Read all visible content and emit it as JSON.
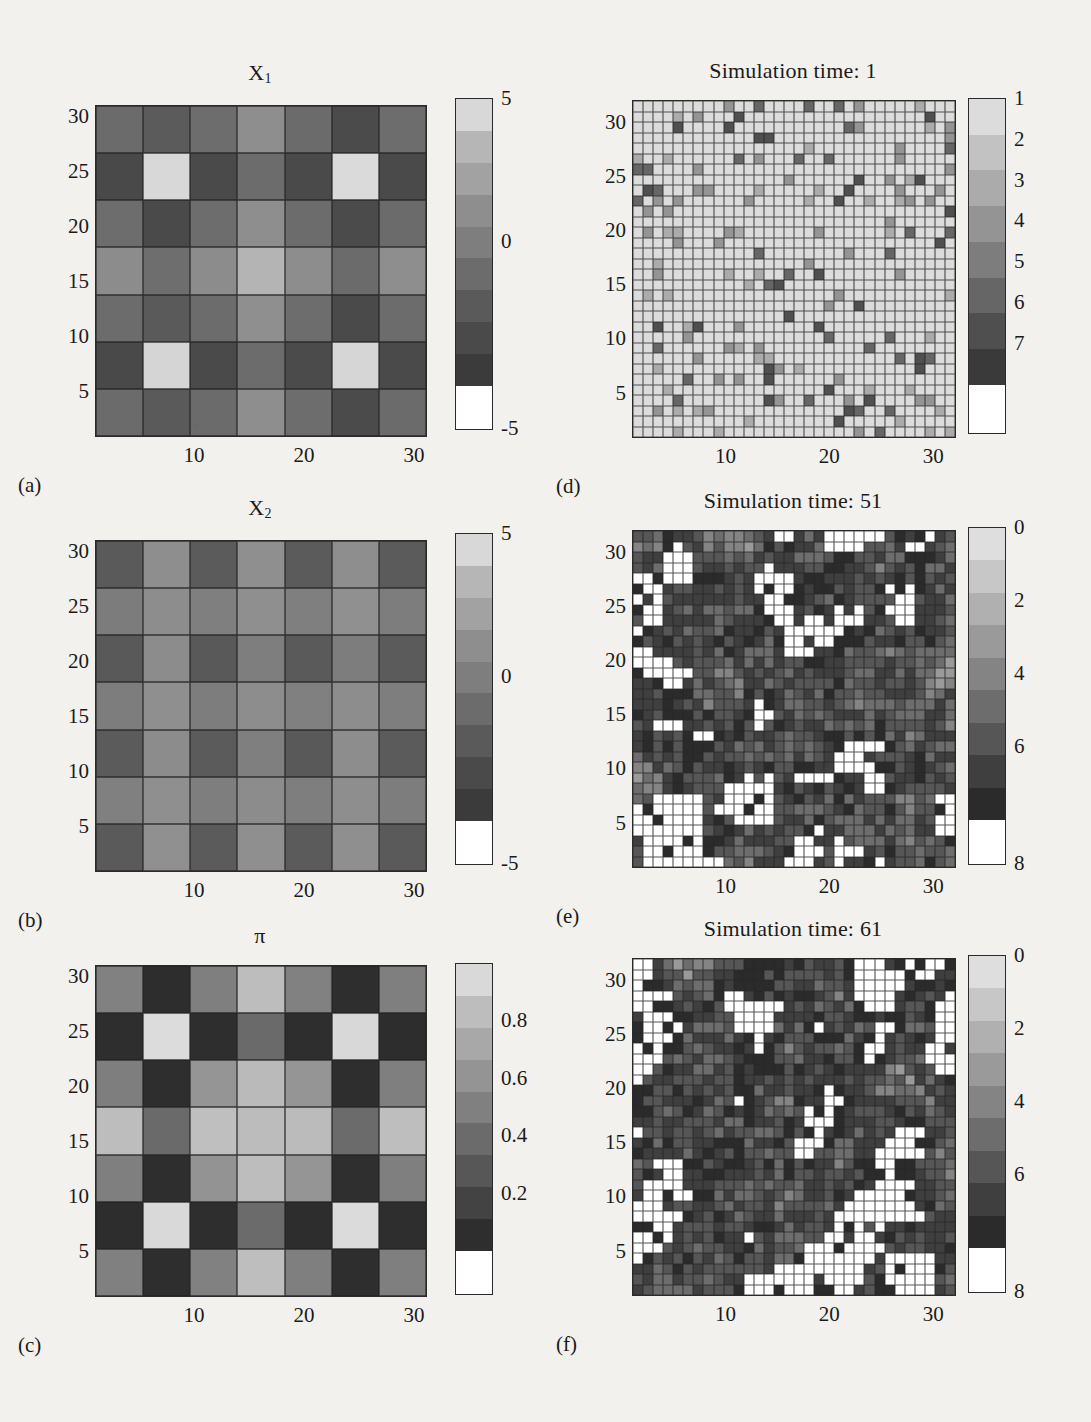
{
  "figure": {
    "background": "#f2f1ed",
    "ink": "#1b1b1b"
  },
  "axes": {
    "y_ticks": [
      "30",
      "25",
      "20",
      "15",
      "10",
      "5"
    ],
    "x_ticks": [
      "10",
      "20",
      "30"
    ]
  },
  "panels": [
    {
      "key": "a",
      "label": "(a)",
      "title": "X",
      "title_sub": "1",
      "grid_n": 7,
      "colorbar": {
        "ticks": [
          "5",
          "0",
          "-5"
        ],
        "top_value": 5,
        "bottom_value": -5,
        "bands": [
          "#d8d8d8",
          "#b6b6b6",
          "#a2a2a2",
          "#8e8e8e",
          "#7e7e7e",
          "#6c6c6c",
          "#5a5a5a",
          "#4a4a4a",
          "#3b3b3b",
          "#ffffff"
        ]
      }
    },
    {
      "key": "b",
      "label": "(b)",
      "title": "X",
      "title_sub": "2",
      "grid_n": 7,
      "colorbar": {
        "ticks": [
          "5",
          "0",
          "-5"
        ],
        "top_value": 5,
        "bottom_value": -5,
        "bands": [
          "#d8d8d8",
          "#b6b6b6",
          "#a2a2a2",
          "#8e8e8e",
          "#7e7e7e",
          "#6c6c6c",
          "#5a5a5a",
          "#4a4a4a",
          "#3b3b3b",
          "#ffffff"
        ]
      }
    },
    {
      "key": "c",
      "label": "(c)",
      "title": "π",
      "title_sub": "",
      "grid_n": 7,
      "colorbar": {
        "ticks": [
          "0.8",
          "0.6",
          "0.4",
          "0.2"
        ],
        "top_value": 1.0,
        "bottom_value": 0.0,
        "bands": [
          "#d9d9d9",
          "#bdbdbd",
          "#a8a8a8",
          "#949494",
          "#808080",
          "#6b6b6b",
          "#575757",
          "#434343",
          "#2e2e2e",
          "#ffffff"
        ]
      }
    },
    {
      "key": "d",
      "label": "(d)",
      "title": "Simulation time: 1",
      "title_sub": "",
      "grid_n": 32,
      "colorbar": {
        "ticks": [
          "7",
          "6",
          "5",
          "4",
          "3",
          "2",
          "1"
        ],
        "top_value": 7,
        "bottom_value": 0,
        "bands": [
          "#dcdcdc",
          "#c2c2c2",
          "#ababab",
          "#949494",
          "#7d7d7d",
          "#666666",
          "#4f4f4f",
          "#3a3a3a",
          "#ffffff"
        ]
      }
    },
    {
      "key": "e",
      "label": "(e)",
      "title": "Simulation time: 51",
      "title_sub": "",
      "grid_n": 32,
      "colorbar": {
        "ticks": [
          "8",
          "6",
          "4",
          "2",
          "0"
        ],
        "top_value": 8,
        "bottom_value": 0,
        "bands": [
          "#dedede",
          "#c7c7c7",
          "#b0b0b0",
          "#9a9a9a",
          "#848484",
          "#6d6d6d",
          "#565656",
          "#3f3f3f",
          "#2b2b2b",
          "#ffffff"
        ]
      }
    },
    {
      "key": "f",
      "label": "(f)",
      "title": "Simulation time: 61",
      "title_sub": "",
      "grid_n": 32,
      "colorbar": {
        "ticks": [
          "8",
          "6",
          "4",
          "2",
          "0"
        ],
        "top_value": 8,
        "bottom_value": 0,
        "bands": [
          "#dedede",
          "#c7c7c7",
          "#b0b0b0",
          "#9a9a9a",
          "#848484",
          "#6d6d6d",
          "#565656",
          "#3f3f3f",
          "#2b2b2b",
          "#ffffff"
        ]
      }
    }
  ],
  "chart_data": [
    {
      "panel": "a",
      "type": "heatmap",
      "title": "X_1",
      "xlabel": "",
      "ylabel": "",
      "grid": "7x7",
      "xlim": [
        1,
        31
      ],
      "ylim": [
        1,
        31
      ],
      "xticks": [
        10,
        20,
        30
      ],
      "yticks": [
        30,
        25,
        20,
        15,
        10,
        5
      ],
      "colorbar_range": [
        -5,
        5
      ],
      "colorbar_ticks": [
        5,
        0,
        -5
      ],
      "values": [
        [
          -0.6,
          -2.6,
          -1.0,
          1.6,
          -0.8,
          -2.8,
          -0.6
        ],
        [
          -2.8,
          5.0,
          -2.9,
          -1.5,
          -2.9,
          5.0,
          -2.8
        ],
        [
          -0.7,
          -2.8,
          -0.7,
          1.2,
          -1.0,
          -2.9,
          -0.7
        ],
        [
          1.6,
          -0.7,
          1.1,
          3.2,
          1.2,
          -0.8,
          1.5
        ],
        [
          -0.7,
          -2.7,
          -0.6,
          1.4,
          -0.8,
          -2.8,
          -0.6
        ],
        [
          -2.8,
          5.0,
          -2.8,
          -1.3,
          -2.8,
          5.0,
          -2.8
        ],
        [
          -0.6,
          -2.6,
          -0.9,
          1.5,
          -0.7,
          -2.8,
          -0.7
        ]
      ]
    },
    {
      "panel": "b",
      "type": "heatmap",
      "title": "X_2",
      "xlabel": "",
      "ylabel": "",
      "grid": "7x7",
      "xlim": [
        1,
        31
      ],
      "ylim": [
        1,
        31
      ],
      "xticks": [
        10,
        20,
        30
      ],
      "yticks": [
        30,
        25,
        20,
        15,
        10,
        5
      ],
      "colorbar_range": [
        -5,
        5
      ],
      "colorbar_ticks": [
        5,
        0,
        -5
      ],
      "values": [
        [
          -2.6,
          0.6,
          -2.6,
          0.6,
          -2.6,
          0.6,
          -2.6
        ],
        [
          0.4,
          1.6,
          0.3,
          1.6,
          0.3,
          1.6,
          0.4
        ],
        [
          -2.7,
          0.6,
          -2.6,
          0.4,
          -2.7,
          0.5,
          -2.7
        ],
        [
          0.4,
          1.6,
          0.3,
          1.2,
          0.3,
          1.6,
          0.4
        ],
        [
          -2.7,
          0.6,
          -2.6,
          0.4,
          -2.7,
          0.6,
          -2.7
        ],
        [
          0.4,
          1.6,
          0.4,
          1.6,
          0.3,
          1.6,
          0.4
        ],
        [
          -2.6,
          0.6,
          -2.6,
          0.6,
          -2.6,
          0.6,
          -2.6
        ]
      ]
    },
    {
      "panel": "c",
      "type": "heatmap",
      "title": "pi",
      "xlabel": "",
      "ylabel": "",
      "grid": "7x7",
      "xlim": [
        1,
        31
      ],
      "ylim": [
        1,
        31
      ],
      "xticks": [
        10,
        20,
        30
      ],
      "yticks": [
        30,
        25,
        20,
        15,
        10,
        5
      ],
      "colorbar_range": [
        0.0,
        1.0
      ],
      "colorbar_ticks": [
        0.8,
        0.6,
        0.4,
        0.2
      ],
      "values": [
        [
          0.55,
          0.1,
          0.55,
          0.8,
          0.55,
          0.1,
          0.55
        ],
        [
          0.1,
          1.0,
          0.1,
          0.42,
          0.1,
          1.0,
          0.1
        ],
        [
          0.55,
          0.1,
          0.58,
          0.78,
          0.58,
          0.1,
          0.55
        ],
        [
          0.82,
          0.4,
          0.8,
          0.88,
          0.8,
          0.42,
          0.82
        ],
        [
          0.55,
          0.1,
          0.58,
          0.78,
          0.58,
          0.1,
          0.55
        ],
        [
          0.1,
          1.0,
          0.1,
          0.42,
          0.1,
          1.0,
          0.1
        ],
        [
          0.55,
          0.1,
          0.55,
          0.8,
          0.55,
          0.1,
          0.55
        ]
      ]
    },
    {
      "panel": "d",
      "type": "heatmap",
      "title": "Simulation time: 1",
      "xlabel": "",
      "ylabel": "",
      "grid": "32x32",
      "xlim": [
        1,
        32
      ],
      "ylim": [
        1,
        32
      ],
      "xticks": [
        10,
        20,
        30
      ],
      "yticks": [
        30,
        25,
        20,
        15,
        10,
        5
      ],
      "colorbar_range": [
        0,
        7
      ],
      "colorbar_ticks": [
        1,
        2,
        3,
        4,
        5,
        6,
        7
      ],
      "description": "Sparse initial condition: nearly all cells at the maximum value (white / light), with scattered isolated dark cells at low values."
    },
    {
      "panel": "e",
      "type": "heatmap",
      "title": "Simulation time: 51",
      "xlabel": "",
      "ylabel": "",
      "grid": "32x32",
      "xlim": [
        1,
        32
      ],
      "ylim": [
        1,
        32
      ],
      "xticks": [
        10,
        20,
        30
      ],
      "yticks": [
        30,
        25,
        20,
        15,
        10,
        5
      ],
      "colorbar_range": [
        0,
        8
      ],
      "colorbar_ticks": [
        0,
        2,
        4,
        6,
        8
      ],
      "description": "Mid simulation: dense mixture of mid-gray cells with clustered white (value 0) patches spreading across the lattice."
    },
    {
      "panel": "f",
      "type": "heatmap",
      "title": "Simulation time: 61",
      "xlabel": "",
      "ylabel": "",
      "grid": "32x32",
      "xlim": [
        1,
        32
      ],
      "ylim": [
        1,
        32
      ],
      "xticks": [
        10,
        20,
        30
      ],
      "yticks": [
        30,
        25,
        20,
        15,
        10,
        5
      ],
      "colorbar_range": [
        0,
        8
      ],
      "colorbar_ticks": [
        0,
        2,
        4,
        6,
        8
      ],
      "description": "Later simulation: white (value 0) regions have grown and merged into larger connected clusters over a mid-gray background."
    }
  ]
}
